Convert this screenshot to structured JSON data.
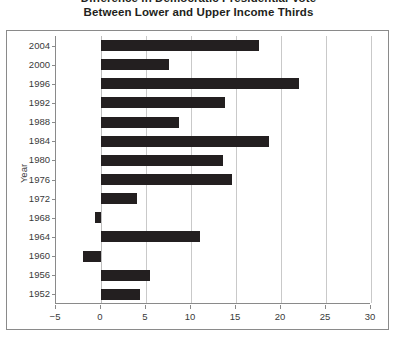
{
  "chart_data": {
    "type": "bar",
    "orientation": "horizontal",
    "title": "Difference in Democratic Presidential Vote\nBetween Lower and Upper Income Thirds",
    "title_lines": [
      "Difference in Democratic Presidential Vote",
      "Between Lower and Upper Income Thirds"
    ],
    "xlabel": "",
    "ylabel": "Year",
    "categories": [
      "2004",
      "2000",
      "1996",
      "1992",
      "1988",
      "1984",
      "1980",
      "1976",
      "1972",
      "1968",
      "1964",
      "1960",
      "1956",
      "1952"
    ],
    "values": [
      17.6,
      7.6,
      22.0,
      13.8,
      8.7,
      18.7,
      13.6,
      14.6,
      4.0,
      -0.7,
      11.0,
      -2.0,
      5.4,
      4.3
    ],
    "xlim": [
      -5,
      30
    ],
    "ylim_categories_top_to_bottom": true,
    "xticks": [
      -5,
      0,
      5,
      10,
      15,
      20,
      25,
      30
    ],
    "xticklabels": [
      "−5",
      "0",
      "5",
      "10",
      "15",
      "20",
      "25",
      "30"
    ],
    "grid": "vertical",
    "legend": "none",
    "bar_color": "#231f20",
    "gridline_color": "#c9c9c9",
    "axis_color": "#8a8a8a"
  },
  "colors": {
    "bar": "#231f20",
    "grid": "#c9c9c9",
    "axis": "#8a8a8a",
    "text": "#3a3a3a",
    "background": "#ffffff"
  }
}
